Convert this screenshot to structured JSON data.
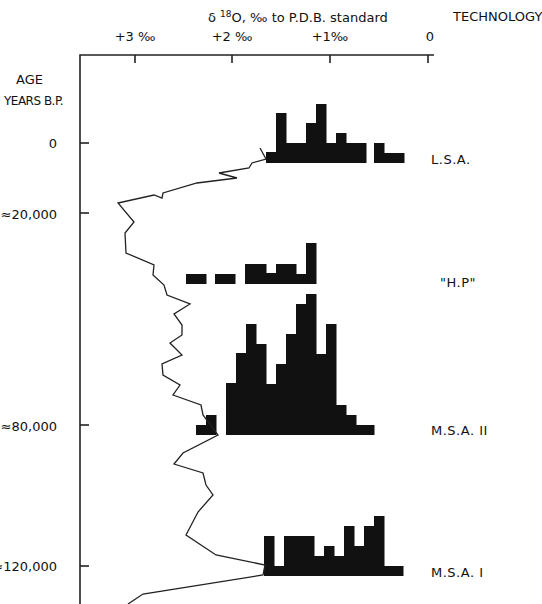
{
  "chart_data": {
    "type": "line+histogram",
    "title_parts": {
      "delta": "δ",
      "sup": "18",
      "rest": "O, ‰ to P.D.B. standard"
    },
    "right_header": "TECHNOLOGY",
    "x_axis": {
      "label": "δ18O ‰ (reversed)",
      "ticks": [
        "+3 ‰",
        "+2 ‰",
        "+1‰",
        "0"
      ],
      "tick_values": [
        3,
        2,
        1,
        0
      ],
      "range": [
        3.56,
        0
      ]
    },
    "y_axis": {
      "label_line1": "AGE",
      "label_line2": "YEARS B.P.",
      "ticks": [
        "0",
        "≈20,000",
        "≈80,000",
        "≈120,000"
      ],
      "tick_values": [
        0,
        20000,
        80000,
        120000
      ],
      "direction": "downward"
    },
    "technology_labels": [
      {
        "label": "L.S.A.",
        "age_approx": 0
      },
      {
        "label": "\"H.P\"",
        "age_approx": 40000
      },
      {
        "label": "M.S.A. II",
        "age_approx": 80000
      },
      {
        "label": "M.S.A. I",
        "age_approx": 120000
      }
    ],
    "o18_curve_px": [
      [
        260,
        148
      ],
      [
        266,
        159
      ],
      [
        252,
        163
      ],
      [
        249,
        168
      ],
      [
        219,
        173
      ],
      [
        237,
        178
      ],
      [
        197,
        183
      ],
      [
        163,
        193
      ],
      [
        162,
        198
      ],
      [
        154,
        195
      ],
      [
        118,
        203
      ],
      [
        134,
        222
      ],
      [
        125,
        233
      ],
      [
        126,
        253
      ],
      [
        154,
        265
      ],
      [
        153,
        275
      ],
      [
        164,
        285
      ],
      [
        167,
        295
      ],
      [
        190,
        304
      ],
      [
        174,
        314
      ],
      [
        182,
        325
      ],
      [
        182,
        335
      ],
      [
        170,
        343
      ],
      [
        182,
        355
      ],
      [
        162,
        364
      ],
      [
        163,
        375
      ],
      [
        180,
        385
      ],
      [
        173,
        395
      ],
      [
        201,
        405
      ],
      [
        203,
        415
      ],
      [
        218,
        435
      ],
      [
        183,
        453
      ],
      [
        174,
        464
      ],
      [
        203,
        473
      ],
      [
        206,
        485
      ],
      [
        213,
        495
      ],
      [
        198,
        512
      ],
      [
        186,
        535
      ],
      [
        216,
        555
      ],
      [
        265,
        565
      ],
      [
        263,
        575
      ],
      [
        143,
        594
      ],
      [
        128,
        604
      ]
    ],
    "histograms": [
      {
        "name": "L.S.A.",
        "baseline": 163,
        "bars": [
          [
            266,
            276,
            152
          ],
          [
            276,
            286,
            113
          ],
          [
            286,
            306,
            143
          ],
          [
            306,
            316,
            123
          ],
          [
            316,
            326,
            104
          ],
          [
            326,
            336,
            143
          ],
          [
            336,
            346,
            133
          ],
          [
            346,
            366,
            143
          ],
          [
            374,
            384,
            143
          ],
          [
            384,
            404,
            153
          ]
        ]
      },
      {
        "name": "H.P",
        "baseline": 284,
        "bars": [
          [
            186,
            206,
            274
          ],
          [
            215,
            235,
            274
          ],
          [
            245,
            266,
            264
          ],
          [
            266,
            276,
            273
          ],
          [
            276,
            296,
            264
          ],
          [
            296,
            306,
            274
          ],
          [
            306,
            316,
            243
          ]
        ]
      },
      {
        "name": "M.S.A. II",
        "baseline": 435,
        "bars": [
          [
            196,
            206,
            425
          ],
          [
            206,
            216,
            415
          ],
          [
            226,
            236,
            383
          ],
          [
            236,
            246,
            353
          ],
          [
            246,
            256,
            324
          ],
          [
            256,
            266,
            344
          ],
          [
            266,
            276,
            384
          ],
          [
            276,
            286,
            364
          ],
          [
            286,
            296,
            334
          ],
          [
            296,
            306,
            304
          ],
          [
            306,
            316,
            294
          ],
          [
            316,
            326,
            354
          ],
          [
            326,
            336,
            324
          ],
          [
            336,
            346,
            405
          ],
          [
            346,
            356,
            415
          ],
          [
            356,
            374,
            425
          ]
        ]
      },
      {
        "name": "M.S.A. I",
        "baseline": 576,
        "bars": [
          [
            264,
            274,
            536
          ],
          [
            274,
            284,
            566
          ],
          [
            284,
            314,
            536
          ],
          [
            314,
            324,
            556
          ],
          [
            324,
            334,
            546
          ],
          [
            334,
            344,
            556
          ],
          [
            344,
            354,
            526
          ],
          [
            354,
            364,
            546
          ],
          [
            364,
            374,
            526
          ],
          [
            374,
            384,
            516
          ],
          [
            384,
            403,
            566
          ]
        ]
      }
    ],
    "grid": false,
    "legend": null
  }
}
